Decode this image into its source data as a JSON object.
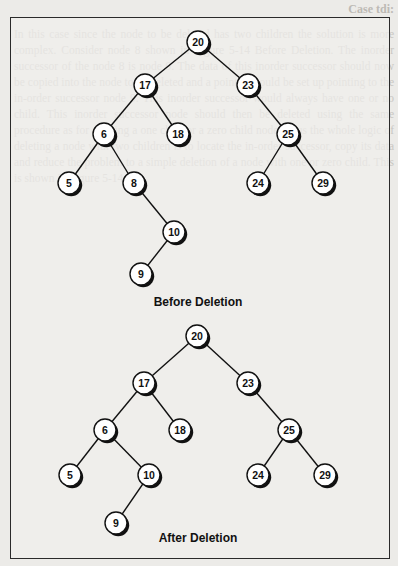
{
  "page": {
    "header_fragment": "Case tdi:",
    "faint_background_text": "In this case since the node to be deleted has two children the solution is more complex. Consider node 8 shown in Figure 5-14 Before Deletion. The inorder successor of the node 8 is node 9. The data of this inorder successor should now be copied into the node to be deleted and a pointer should be set up pointing to the in-order successor node 9. This inorder successor would always have one or no child. This inorder successor node should then be deleted using the same procedure as for deleting a one child or a zero child node. Thus the whole logic of deleting a node with two children is to locate the in-order successor, copy its data and reduce the problem to a simple deletion of a node with one or zero child. This is shown in Figure 5-14."
  },
  "diagrams": [
    {
      "id": "before",
      "caption": "Before Deletion",
      "caption_pos": [
        198,
        302
      ],
      "nodes": [
        {
          "key": "20",
          "x": 198,
          "y": 42
        },
        {
          "key": "17",
          "x": 145,
          "y": 85
        },
        {
          "key": "23",
          "x": 248,
          "y": 85
        },
        {
          "key": "6",
          "x": 104,
          "y": 134
        },
        {
          "key": "18",
          "x": 178,
          "y": 134
        },
        {
          "key": "25",
          "x": 288,
          "y": 134
        },
        {
          "key": "5",
          "x": 69,
          "y": 183
        },
        {
          "key": "8",
          "x": 134,
          "y": 183
        },
        {
          "key": "24",
          "x": 258,
          "y": 183
        },
        {
          "key": "29",
          "x": 323,
          "y": 183
        },
        {
          "key": "10",
          "x": 174,
          "y": 232
        },
        {
          "key": "9",
          "x": 141,
          "y": 274
        }
      ],
      "edges": [
        [
          "20",
          "17"
        ],
        [
          "20",
          "23"
        ],
        [
          "17",
          "6"
        ],
        [
          "17",
          "18"
        ],
        [
          "23",
          "25"
        ],
        [
          "6",
          "5"
        ],
        [
          "6",
          "8"
        ],
        [
          "25",
          "24"
        ],
        [
          "25",
          "29"
        ],
        [
          "8",
          "10"
        ],
        [
          "10",
          "9"
        ]
      ]
    },
    {
      "id": "after",
      "caption": "After Deletion",
      "caption_pos": [
        198,
        538
      ],
      "nodes": [
        {
          "key": "20",
          "x": 197,
          "y": 336
        },
        {
          "key": "17",
          "x": 144,
          "y": 383
        },
        {
          "key": "23",
          "x": 248,
          "y": 383
        },
        {
          "key": "6",
          "x": 105,
          "y": 430
        },
        {
          "key": "18",
          "x": 180,
          "y": 430
        },
        {
          "key": "25",
          "x": 289,
          "y": 430
        },
        {
          "key": "5",
          "x": 70,
          "y": 475
        },
        {
          "key": "10",
          "x": 149,
          "y": 475
        },
        {
          "key": "24",
          "x": 258,
          "y": 475
        },
        {
          "key": "29",
          "x": 325,
          "y": 475
        },
        {
          "key": "9",
          "x": 116,
          "y": 523
        }
      ],
      "edges": [
        [
          "20",
          "17"
        ],
        [
          "20",
          "23"
        ],
        [
          "17",
          "6"
        ],
        [
          "17",
          "18"
        ],
        [
          "23",
          "25"
        ],
        [
          "6",
          "5"
        ],
        [
          "6",
          "10"
        ],
        [
          "25",
          "24"
        ],
        [
          "25",
          "29"
        ],
        [
          "10",
          "9"
        ]
      ]
    }
  ],
  "style": {
    "node_radius": 11,
    "node_fill": "#ffffff",
    "node_stroke": "#111111",
    "edge_color": "#111111",
    "shadow_color": "#111111"
  }
}
